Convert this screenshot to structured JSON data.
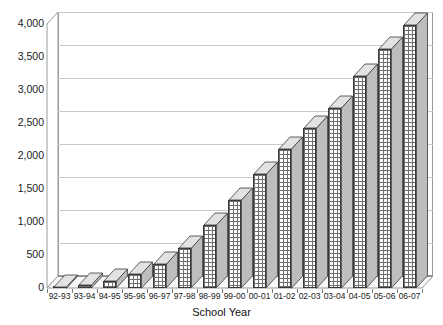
{
  "chart_data": {
    "type": "bar",
    "title": "",
    "xlabel": "School Year",
    "ylabel": "",
    "categories": [
      "92-93",
      "93-94",
      "94-95",
      "95-96",
      "96-97",
      "97-98",
      "98-99",
      "99-00",
      "00-01",
      "01-02",
      "02-03",
      "03-04",
      "04-05",
      "05-06",
      "06-07"
    ],
    "values": [
      20,
      45,
      105,
      215,
      360,
      600,
      950,
      1330,
      1720,
      2110,
      2430,
      2730,
      3210,
      3620,
      3980
    ],
    "series": [
      {
        "name": "Count",
        "values": [
          20,
          45,
          105,
          215,
          360,
          600,
          950,
          1330,
          1720,
          2110,
          2430,
          2730,
          3210,
          3620,
          3980
        ]
      }
    ],
    "ylim": [
      0,
      4000
    ],
    "ytick_values": [
      0,
      500,
      1000,
      1500,
      2000,
      2500,
      3000,
      3500,
      4000
    ],
    "ytick_labels": [
      "0",
      "500",
      "1,000",
      "1,500",
      "2,000",
      "2,500",
      "3,000",
      "3,500",
      "4,000"
    ],
    "grid": true,
    "legend": false,
    "legend_position": "none",
    "style_3d": true
  },
  "axes": {
    "x_title": "School Year"
  },
  "title_fragment": "",
  "colors": {
    "bar_face": "#fdfdfd",
    "bar_hatch": "#6f6f6f",
    "bar_side": "#bdbdbd",
    "bar_top": "#e2e2e2",
    "bar_outline": "#3a3a3a",
    "gridline": "#c9c9c9",
    "frame": "#9a9a9a",
    "text": "#1a1a1a",
    "background": "#ffffff"
  }
}
